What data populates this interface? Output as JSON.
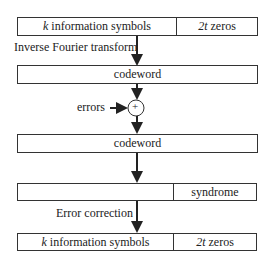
{
  "diagram": {
    "top_box": {
      "left_label_var": "k",
      "left_label": "information symbols",
      "right_label_var": "2t",
      "right_label": "zeros"
    },
    "step1_label": "Inverse Fourier transform",
    "codeword_box_1": {
      "label": "codeword"
    },
    "errors_label": "errors",
    "adder_symbol": "+",
    "codeword_box_2": {
      "label": "codeword"
    },
    "syndrome_box": {
      "left_label": "",
      "right_label": "syndrome"
    },
    "step2_label": "Error correction",
    "bottom_box": {
      "left_label_var": "k",
      "left_label": "information symbols",
      "right_label_var": "2t",
      "right_label": "zeros"
    },
    "line_color": "#222222"
  }
}
